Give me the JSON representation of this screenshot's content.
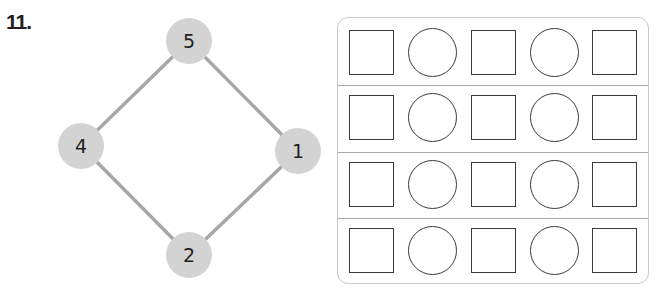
{
  "problem": {
    "number_label": "11."
  },
  "diagram": {
    "node_color": "#d3d3d3",
    "edge_color": "#a7a7a7",
    "nodes": [
      {
        "id": "top",
        "label": "5",
        "cx": 189,
        "cy": 41
      },
      {
        "id": "left",
        "label": "4",
        "cx": 81,
        "cy": 146
      },
      {
        "id": "right",
        "label": "1",
        "cx": 298,
        "cy": 151
      },
      {
        "id": "bottom",
        "label": "2",
        "cx": 189,
        "cy": 255
      }
    ],
    "edges": [
      [
        "top",
        "left"
      ],
      [
        "top",
        "right"
      ],
      [
        "left",
        "bottom"
      ],
      [
        "right",
        "bottom"
      ]
    ]
  },
  "answer_grid": {
    "rows": [
      {
        "cells": [
          "square",
          "circle",
          "square",
          "circle",
          "square"
        ]
      },
      {
        "cells": [
          "square",
          "circle",
          "square",
          "circle",
          "square"
        ]
      },
      {
        "cells": [
          "square",
          "circle",
          "square",
          "circle",
          "square"
        ]
      },
      {
        "cells": [
          "square",
          "circle",
          "square",
          "circle",
          "square"
        ]
      }
    ]
  }
}
